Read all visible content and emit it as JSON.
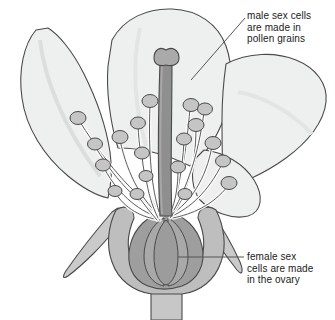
{
  "diagram": {
    "background_color": "#ffffff",
    "style": "grayscale line drawing"
  },
  "labels": {
    "male": {
      "name": "male-sex-cells-label",
      "lines": [
        "male sex cells",
        "are made in",
        "pollen grains"
      ],
      "line1": "male sex cells",
      "line2": "are made in",
      "line3": "pollen grains",
      "leader": {
        "x1": 245,
        "y1": 18,
        "x2": 191,
        "y2": 80
      }
    },
    "female": {
      "name": "female-sex-cells-label",
      "lines": [
        "female sex",
        "cells are made",
        "in the ovary"
      ],
      "line1": "female sex",
      "line2": "cells are made",
      "line3": "in the ovary",
      "leader": {
        "x1": 244,
        "y1": 257,
        "x2": 178,
        "y2": 257
      }
    }
  },
  "parts": {
    "petal": {
      "name": "petal",
      "fill": "#eef0ef",
      "stroke": "#4a4a4a"
    },
    "petal_shade": {
      "name": "petal-vein",
      "fill": "#e2e5e4"
    },
    "sepal": {
      "name": "sepal",
      "fill": "#c9cac9",
      "stroke": "#4a4a4a"
    },
    "receptacle": {
      "name": "receptacle",
      "fill": "#bdbebd",
      "stroke": "#4a4a4a"
    },
    "stem": {
      "name": "stem",
      "fill": "#c6c7c6",
      "stroke": "#4a4a4a"
    },
    "ovary_outer": {
      "name": "ovary-wall",
      "fill": "#9d9e9d",
      "stroke": "#4a4a4a"
    },
    "ovary_inner": {
      "name": "ovule",
      "fill": "#a8a9a8",
      "stroke": "#4a4a4a"
    },
    "style": {
      "name": "style",
      "fill": "#8e8f8e",
      "stroke": "#4a4a4a"
    },
    "stigma": {
      "name": "stigma",
      "fill": "#a9aaa9",
      "stroke": "#4a4a4a"
    },
    "filament": {
      "name": "filament",
      "fill": "#fdfdfd",
      "stroke": "#4a4a4a"
    },
    "anther": {
      "name": "anther",
      "fill": "#c4c5c4",
      "stroke": "#4a4a4a"
    },
    "leader_line": {
      "name": "leader-line",
      "stroke": "#555555"
    }
  },
  "counts": {
    "petals": 4,
    "stamens": 18,
    "sepals": 2
  }
}
